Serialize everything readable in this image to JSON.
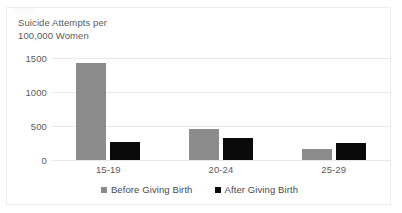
{
  "chart_data": {
    "type": "bar",
    "title": "Suicide  Attempts per\n100,000 Women",
    "xlabel": "",
    "ylabel": "",
    "ylim": [
      0,
      1500
    ],
    "yticks": [
      0,
      500,
      1000,
      1500
    ],
    "ytick_labels": [
      "0",
      "500",
      "1000",
      "1500"
    ],
    "categories": [
      "15-19",
      "20-24",
      "25-29"
    ],
    "grid": true,
    "legend_position": "bottom",
    "series": [
      {
        "name": "Before Giving Birth",
        "color": "#8C8C8C",
        "values": [
          1430,
          450,
          165
        ]
      },
      {
        "name": "After Giving Birth",
        "color": "#0A0A0A",
        "values": [
          270,
          330,
          255
        ]
      }
    ]
  },
  "legend": {
    "items": [
      {
        "label": "Before Giving Birth",
        "swatch": "before"
      },
      {
        "label": "After Giving Birth",
        "swatch": "after"
      }
    ]
  }
}
